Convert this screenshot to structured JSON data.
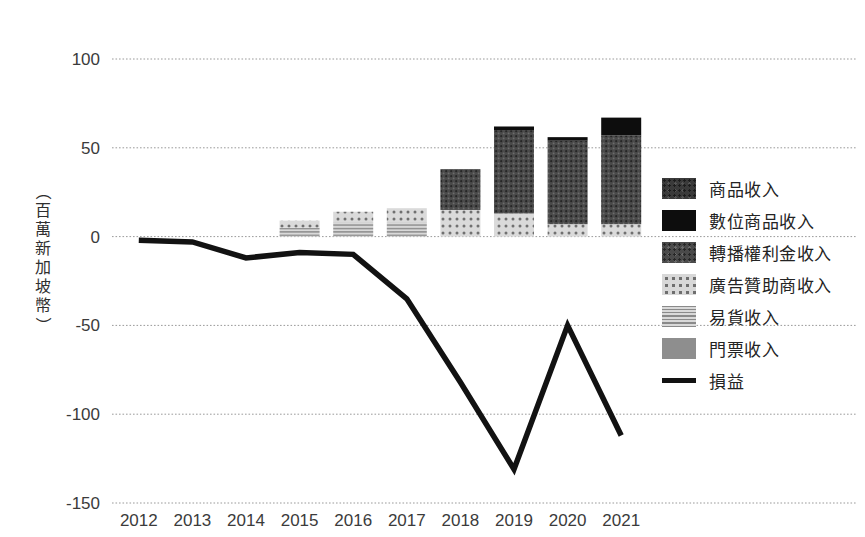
{
  "chart_data": {
    "type": "bar",
    "title": "",
    "subtitle": "",
    "xlabel": "",
    "ylabel": "（百萬新加坡幣）",
    "categories": [
      "2012",
      "2013",
      "2014",
      "2015",
      "2016",
      "2017",
      "2018",
      "2019",
      "2020",
      "2021"
    ],
    "ylim": [
      -150,
      100
    ],
    "yticks": [
      100,
      50,
      0,
      -50,
      -100,
      -150
    ],
    "ytick_labels": [
      "100",
      "50",
      "0",
      "-50",
      "-100",
      "-150"
    ],
    "grid": true,
    "stacked": true,
    "legend_position": "right",
    "series": [
      {
        "name": "商品收入",
        "key": "merchandise",
        "pattern": "dark-speckle",
        "color": "#3a3a3a",
        "values": [
          0,
          0,
          0,
          0,
          0,
          0,
          0,
          0,
          0,
          0
        ]
      },
      {
        "name": "數位商品收入",
        "key": "digital",
        "pattern": "solid-black",
        "color": "#0d0d0d",
        "values": [
          0,
          0,
          0,
          0,
          0,
          0,
          0,
          2,
          2,
          10
        ]
      },
      {
        "name": "轉播權利金收入",
        "key": "broadcast",
        "pattern": "mid-speckle",
        "color": "#4a4a4a",
        "values": [
          0,
          0,
          0,
          0,
          0,
          0,
          23,
          47,
          47,
          50
        ]
      },
      {
        "name": "廣告贊助商收入",
        "key": "advertising",
        "pattern": "light-dots",
        "color": "#d8d8d8",
        "values": [
          0,
          0,
          0,
          4,
          6,
          8,
          15,
          13,
          7,
          7
        ]
      },
      {
        "name": "易貨收入",
        "key": "barter",
        "pattern": "horizontal-stripes",
        "color": "#cfcfcf",
        "values": [
          0,
          0,
          0,
          5,
          8,
          8,
          0,
          0,
          0,
          0
        ]
      },
      {
        "name": "門票收入",
        "key": "ticketing",
        "pattern": "solid-gray",
        "color": "#8e8e8e",
        "values": [
          0,
          0,
          0,
          0,
          0,
          0,
          0,
          0,
          0,
          0
        ]
      }
    ],
    "line_series": {
      "name": "損益",
      "color": "#121212",
      "values": [
        -2,
        -3,
        -12,
        -9,
        -10,
        -35,
        -82,
        -131,
        -50,
        -112
      ]
    }
  },
  "legend": {
    "items": [
      {
        "label": "商品收入",
        "swatch": "sw-merch"
      },
      {
        "label": "數位商品收入",
        "swatch": "sw-digital"
      },
      {
        "label": "轉播權利金收入",
        "swatch": "sw-broad"
      },
      {
        "label": "廣告贊助商收入",
        "swatch": "sw-ads"
      },
      {
        "label": "易貨收入",
        "swatch": "sw-barter"
      },
      {
        "label": "門票收入",
        "swatch": "sw-ticket"
      }
    ],
    "line_item": {
      "label": "損益"
    }
  },
  "axis": {
    "y_title_chars": [
      "（",
      "百",
      "萬",
      "新",
      "加",
      "坡",
      "幣",
      "）"
    ]
  }
}
